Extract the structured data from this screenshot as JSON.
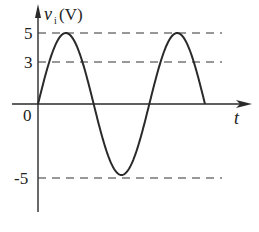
{
  "diagram": {
    "y_axis_label": "v",
    "y_axis_subscript": "i",
    "y_axis_unit": "(V)",
    "x_axis_label": "t",
    "origin_label": "0",
    "ticks": [
      {
        "label": "5",
        "value": 5
      },
      {
        "label": "3",
        "value": 3
      },
      {
        "label": "-5",
        "value": -5
      }
    ],
    "waveform": "sine, 1.5 periods, amplitude 5 V",
    "colors": {
      "line": "#2a2a2a",
      "dash": "#333333"
    }
  }
}
